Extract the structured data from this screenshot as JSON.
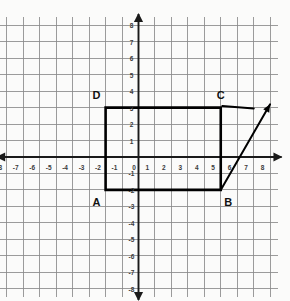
{
  "figure": {
    "kind": "coordinate-grid-geometry-figure",
    "background_color": "#fbfbfa",
    "grid_color": "#8a8a8a",
    "axis_color": "#1a1a1a",
    "shape_color": "#000000"
  },
  "chart_data": {
    "type": "scatter",
    "title": "",
    "xlabel": "",
    "ylabel": "",
    "xlim": [
      -8.5,
      8.5
    ],
    "ylim": [
      -8.5,
      8.5
    ],
    "grid": true,
    "legend": null,
    "x_ticks": [
      -8,
      -7,
      -6,
      -5,
      -4,
      -3,
      -2,
      -1,
      0,
      1,
      2,
      3,
      4,
      5,
      6,
      7,
      8
    ],
    "y_ticks": [
      -8,
      -7,
      -6,
      -5,
      -4,
      -3,
      -2,
      -1,
      1,
      2,
      3,
      4,
      5,
      6,
      7,
      8
    ],
    "x_tick_labels": [
      "-8",
      "-7",
      "-6",
      "-5",
      "-4",
      "-3",
      "-2",
      "-1",
      "0",
      "1",
      "2",
      "3",
      "4",
      "5",
      "6",
      "7",
      "8"
    ],
    "y_tick_labels": [
      "-8",
      "-7",
      "-6",
      "-5",
      "-4",
      "-3",
      "-2",
      "-1",
      "1",
      "2",
      "3",
      "4",
      "5",
      "6",
      "7",
      "8"
    ],
    "shapes": [
      {
        "name": "rectangle-ABCD",
        "type": "polygon",
        "closed": true,
        "stroke": "#000000",
        "stroke_width": 2.6,
        "fill": "none",
        "points": [
          {
            "label": "A",
            "x": -2,
            "y": -2
          },
          {
            "label": "B",
            "x": 5,
            "y": -2
          },
          {
            "label": "C",
            "x": 5,
            "y": 3
          },
          {
            "label": "D",
            "x": -2,
            "y": 3
          }
        ]
      },
      {
        "name": "diagonal-arrow-from-B",
        "type": "arrow",
        "stroke": "#000000",
        "stroke_width": 2.0,
        "from": {
          "x": 5,
          "y": -2
        },
        "to": {
          "x": 8,
          "y": 3.2
        }
      },
      {
        "name": "horizontal-stroke-at-C",
        "type": "segment",
        "stroke": "#000000",
        "stroke_width": 2.2,
        "from": {
          "x": 5.1,
          "y": 3.1
        },
        "to": {
          "x": 7.0,
          "y": 2.95
        }
      }
    ],
    "vertex_labels": [
      {
        "text": "A",
        "x": -2.55,
        "y": -2.75
      },
      {
        "text": "B",
        "x": 5.45,
        "y": -2.75
      },
      {
        "text": "C",
        "x": 5.0,
        "y": 3.75
      },
      {
        "text": "D",
        "x": -2.55,
        "y": 3.75
      }
    ],
    "axis_arrows": {
      "x_left": true,
      "x_right": true,
      "y_up": true,
      "y_down": true
    }
  }
}
